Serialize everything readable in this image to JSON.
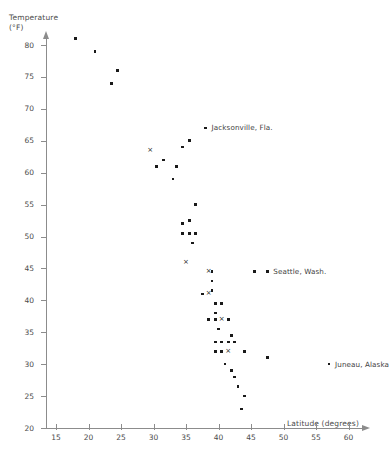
{
  "chart_data": {
    "type": "scatter",
    "title": "",
    "ylabel": "Temperature\n(°F)",
    "xlabel": "Latitude (degrees)",
    "xlim": [
      15,
      63
    ],
    "ylim": [
      20,
      82
    ],
    "xticks": [
      15,
      20,
      25,
      30,
      35,
      40,
      45,
      50,
      55,
      60
    ],
    "yticks": [
      20,
      25,
      30,
      35,
      40,
      45,
      50,
      55,
      60,
      65,
      70,
      75,
      80
    ],
    "grid": false,
    "legend": null,
    "series": [
      {
        "name": "cities-dot",
        "marker": "dot",
        "points": [
          [
            18.0,
            81.0
          ],
          [
            21.0,
            79.0
          ],
          [
            24.5,
            76.0
          ],
          [
            23.5,
            74.0
          ],
          [
            30.5,
            61.0
          ],
          [
            31.5,
            62.0
          ],
          [
            33.5,
            61.0
          ],
          [
            33.0,
            59.0
          ],
          [
            34.5,
            64.0
          ],
          [
            35.5,
            65.0
          ],
          [
            38.0,
            67.0
          ],
          [
            36.5,
            55.0
          ],
          [
            34.5,
            52.0
          ],
          [
            35.5,
            52.5
          ],
          [
            34.5,
            50.5
          ],
          [
            35.5,
            50.5
          ],
          [
            36.5,
            50.5
          ],
          [
            36.0,
            49.0
          ],
          [
            39.0,
            44.5
          ],
          [
            45.5,
            44.5
          ],
          [
            47.5,
            44.5
          ],
          [
            39.0,
            43.0
          ],
          [
            39.0,
            41.5
          ],
          [
            37.5,
            41.0
          ],
          [
            39.5,
            39.5
          ],
          [
            40.5,
            39.5
          ],
          [
            39.5,
            38.0
          ],
          [
            38.5,
            37.0
          ],
          [
            39.5,
            37.0
          ],
          [
            41.5,
            37.0
          ],
          [
            40.0,
            35.5
          ],
          [
            42.0,
            34.5
          ],
          [
            39.5,
            33.5
          ],
          [
            40.5,
            33.5
          ],
          [
            41.5,
            33.5
          ],
          [
            42.5,
            33.5
          ],
          [
            39.5,
            32.0
          ],
          [
            40.5,
            32.0
          ],
          [
            44.0,
            32.0
          ],
          [
            47.5,
            31.0
          ],
          [
            57.0,
            30.0
          ],
          [
            41.0,
            30.0
          ],
          [
            42.0,
            29.0
          ],
          [
            42.5,
            28.0
          ],
          [
            43.0,
            26.5
          ],
          [
            44.0,
            25.0
          ],
          [
            43.5,
            23.0
          ]
        ]
      },
      {
        "name": "cities-cross",
        "marker": "x",
        "points": [
          [
            29.5,
            63.5
          ],
          [
            35.0,
            46.0
          ],
          [
            38.5,
            44.5
          ],
          [
            38.5,
            41.0
          ],
          [
            40.5,
            37.0
          ],
          [
            41.5,
            32.0
          ]
        ]
      }
    ],
    "annotations": [
      {
        "label": "Jacksonville, Fla.",
        "x": 38.0,
        "y": 67.0,
        "dx": 6,
        "dy": 0
      },
      {
        "label": "Seattle, Wash.",
        "x": 47.5,
        "y": 44.5,
        "dx": 6,
        "dy": 0
      },
      {
        "label": "Juneau, Alaska",
        "x": 57.0,
        "y": 30.0,
        "dx": 6,
        "dy": 0
      }
    ]
  },
  "colors": {
    "marker": "#1a1a1a",
    "axis": "#8c8c8c",
    "text": "#4b4b4b",
    "background": "#ffffff"
  }
}
